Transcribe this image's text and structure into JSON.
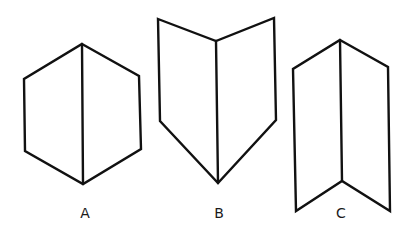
{
  "figures": [
    {
      "id": "A",
      "label": "A",
      "description": "hexagon with vertical center line",
      "outline": [
        [
          82,
          44
        ],
        [
          139,
          76
        ],
        [
          141,
          149
        ],
        [
          83,
          184
        ],
        [
          25,
          151
        ],
        [
          24,
          79
        ]
      ],
      "inner_line": [
        [
          82,
          44
        ],
        [
          83,
          184
        ]
      ],
      "label_pos": [
        85,
        218
      ]
    },
    {
      "id": "B",
      "label": "B",
      "description": "open-book shape folded toward viewer, pointing down",
      "outline": [
        [
          158,
          19
        ],
        [
          216,
          41
        ],
        [
          274,
          18
        ],
        [
          276,
          120
        ],
        [
          218,
          183
        ],
        [
          160,
          121
        ]
      ],
      "inner_line": [
        [
          216,
          41
        ],
        [
          218,
          183
        ]
      ],
      "label_pos": [
        219,
        218
      ]
    },
    {
      "id": "C",
      "label": "C",
      "description": "folded sheet with peak at top and notch at bottom",
      "outline": [
        [
          340,
          40
        ],
        [
          388,
          67
        ],
        [
          390,
          211
        ],
        [
          342,
          181
        ],
        [
          296,
          211
        ],
        [
          293,
          69
        ]
      ],
      "inner_line": [
        [
          340,
          40
        ],
        [
          342,
          181
        ]
      ],
      "label_pos": [
        341,
        218
      ]
    }
  ],
  "colors": {
    "stroke": "#111111",
    "background": "#ffffff",
    "label": "#1a1a1a"
  }
}
